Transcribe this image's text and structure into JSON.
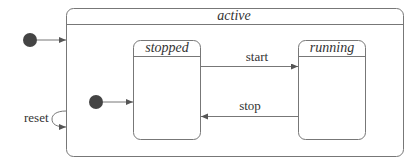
{
  "diagram": {
    "type": "uml-state-machine",
    "composite_state": {
      "name": "active"
    },
    "substates": [
      {
        "id": "stopped",
        "name": "stopped"
      },
      {
        "id": "running",
        "name": "running"
      }
    ],
    "transitions": [
      {
        "from": "stopped",
        "to": "running",
        "label": "start"
      },
      {
        "from": "running",
        "to": "stopped",
        "label": "stop"
      },
      {
        "from": "active",
        "to": "active",
        "label": "reset"
      }
    ],
    "initial_states": [
      {
        "target": "active"
      },
      {
        "target": "stopped"
      }
    ],
    "colors": {
      "stroke": "#777777",
      "initial_node": "#444444",
      "text": "#333333"
    }
  }
}
